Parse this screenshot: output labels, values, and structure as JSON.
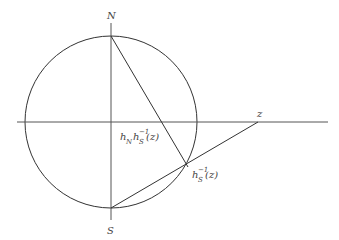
{
  "diagram": {
    "circle": {
      "cx": 111,
      "cy": 122,
      "r": 86
    },
    "points": {
      "N": {
        "label": "N",
        "x": 111,
        "y": 35
      },
      "S": {
        "label": "S",
        "x": 111,
        "y": 208
      },
      "z": {
        "label": "z",
        "x": 258,
        "y": 122
      },
      "inv": {
        "label_main": "h",
        "label_sub": "S",
        "label_sup": "−1",
        "label_tail": "(z)",
        "x": 188,
        "y": 167
      },
      "hn": {
        "label_h": "h",
        "label_n": "N",
        "label_h2": "h",
        "label_sub": "S",
        "label_sup": "−1",
        "label_tail": "(z)",
        "x": 111,
        "y": 122
      }
    },
    "colors": {
      "stroke": "#333333",
      "axis": "#555555",
      "text": "#444444"
    }
  }
}
